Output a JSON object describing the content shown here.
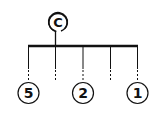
{
  "diagram": {
    "root": {
      "label": "C"
    },
    "leaves": [
      {
        "label": "5"
      },
      {
        "label": "2"
      },
      {
        "label": "1"
      }
    ],
    "colors": {
      "stroke": "#111111",
      "background": "#ffffff"
    }
  }
}
